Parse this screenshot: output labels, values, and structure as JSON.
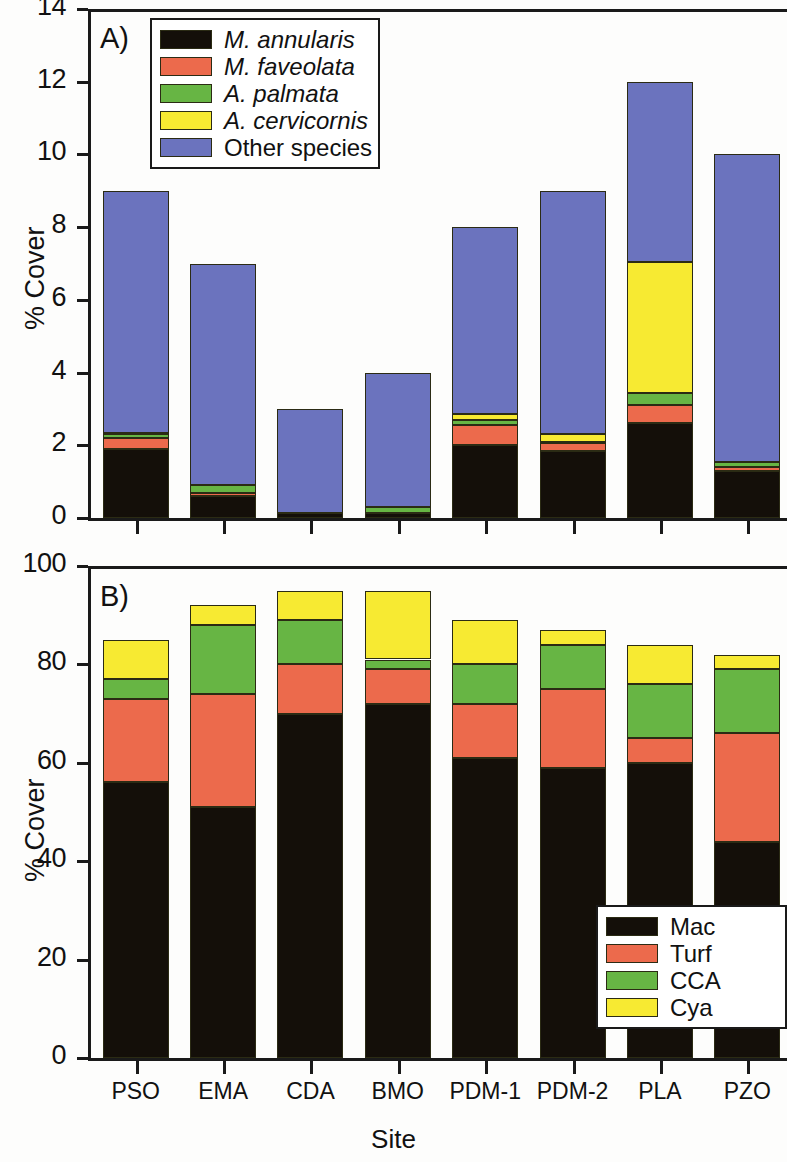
{
  "figure": {
    "xlabel": "Site",
    "sites": [
      "PSO",
      "EMA",
      "CDA",
      "BMO",
      "PDM-1",
      "PDM-2",
      "PLA",
      "PZO"
    ]
  },
  "panelA": {
    "tag": "A)",
    "ylabel": "% Cover",
    "yticks": [
      "0",
      "2",
      "4",
      "6",
      "8",
      "10",
      "12",
      "14"
    ],
    "legend": [
      {
        "label": "M. annularis",
        "color": "#140f09",
        "italic": true
      },
      {
        "label": "M. faveolata",
        "color": "#ec6a4c",
        "italic": true
      },
      {
        "label": "A. palmata",
        "color": "#67b544",
        "italic": true
      },
      {
        "label": "A. cervicornis",
        "color": "#f7ea32",
        "italic": true
      },
      {
        "label": "Other species",
        "color": "#6b73be",
        "italic": false
      }
    ]
  },
  "panelB": {
    "tag": "B)",
    "ylabel": "% Cover",
    "yticks": [
      "0",
      "20",
      "40",
      "60",
      "80",
      "100"
    ],
    "legend": [
      {
        "label": "Mac",
        "color": "#140f09"
      },
      {
        "label": "Turf",
        "color": "#ec6a4c"
      },
      {
        "label": "CCA",
        "color": "#67b544"
      },
      {
        "label": "Cya",
        "color": "#f7ea32"
      }
    ]
  },
  "chart_data": [
    {
      "type": "bar",
      "stacked": true,
      "panel": "A",
      "title": "A)",
      "xlabel": "Site",
      "ylabel": "% Cover",
      "ylim": [
        0,
        14
      ],
      "ytick_step": 2,
      "grid": false,
      "legend_position": "top-left",
      "categories": [
        "PSO",
        "EMA",
        "CDA",
        "BMO",
        "PDM-1",
        "PDM-2",
        "PLA",
        "PZO"
      ],
      "series": [
        {
          "name": "M. annularis",
          "color": "#140f09",
          "values": [
            1.9,
            0.6,
            0.15,
            0.15,
            2.0,
            1.85,
            2.6,
            1.3
          ]
        },
        {
          "name": "M. faveolata",
          "color": "#ec6a4c",
          "values": [
            0.3,
            0.1,
            0.0,
            0.0,
            0.55,
            0.2,
            0.5,
            0.1
          ]
        },
        {
          "name": "A. palmata",
          "color": "#67b544",
          "values": [
            0.1,
            0.2,
            0.0,
            0.15,
            0.15,
            0.05,
            0.35,
            0.15
          ]
        },
        {
          "name": "A. cervicornis",
          "color": "#f7ea32",
          "values": [
            0.05,
            0.0,
            0.0,
            0.0,
            0.15,
            0.2,
            3.6,
            0.0
          ]
        },
        {
          "name": "Other species",
          "color": "#6b73be",
          "values": [
            6.65,
            6.1,
            2.85,
            3.7,
            5.15,
            6.7,
            4.95,
            8.45
          ]
        }
      ],
      "totals": [
        9.0,
        7.0,
        3.0,
        4.0,
        8.0,
        9.0,
        12.0,
        10.0
      ]
    },
    {
      "type": "bar",
      "stacked": true,
      "panel": "B",
      "title": "B)",
      "xlabel": "Site",
      "ylabel": "% Cover",
      "ylim": [
        0,
        100
      ],
      "ytick_step": 20,
      "grid": false,
      "legend_position": "bottom-right",
      "categories": [
        "PSO",
        "EMA",
        "CDA",
        "BMO",
        "PDM-1",
        "PDM-2",
        "PLA",
        "PZO"
      ],
      "series": [
        {
          "name": "Mac",
          "color": "#140f09",
          "values": [
            56,
            51,
            70,
            72,
            61,
            59,
            60,
            44
          ]
        },
        {
          "name": "Turf",
          "color": "#ec6a4c",
          "values": [
            17,
            23,
            10,
            7,
            11,
            16,
            5,
            22
          ]
        },
        {
          "name": "CCA",
          "color": "#67b544",
          "values": [
            4,
            14,
            9,
            2,
            8,
            9,
            11,
            13
          ]
        },
        {
          "name": "Cya",
          "color": "#f7ea32",
          "values": [
            8,
            4,
            6,
            14,
            9,
            3,
            8,
            3
          ]
        }
      ],
      "totals": [
        85,
        92,
        95,
        95,
        89,
        87,
        84,
        82
      ]
    }
  ]
}
